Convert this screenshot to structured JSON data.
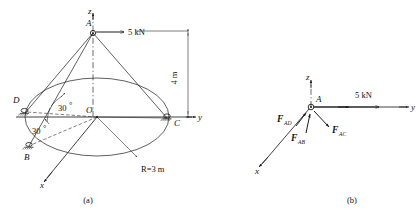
{
  "figure": {
    "panels": [
      {
        "id": "a",
        "caption": "(a)"
      },
      {
        "id": "b",
        "caption": "(b)"
      }
    ]
  },
  "panel_a": {
    "caption": "(a)",
    "axes": {
      "z_label": "z",
      "y_label": "y",
      "x_label": "x",
      "origin_label": "O"
    },
    "points": {
      "apex": "A",
      "support_b": "B",
      "support_c": "C",
      "support_d": "D"
    },
    "loads": {
      "applied_force": "5 kN"
    },
    "dimensions": {
      "height": "4 m",
      "radius": "R=3 m",
      "angle_upper": "30",
      "angle_upper_unit": "°",
      "angle_lower": "30",
      "angle_lower_unit": "°"
    }
  },
  "panel_b": {
    "caption": "(b)",
    "axes": {
      "z_label": "z",
      "y_label": "y",
      "x_label": "x"
    },
    "points": {
      "apex": "A"
    },
    "loads": {
      "applied_force": "5 kN"
    },
    "forces": [
      {
        "symbol": "F",
        "sub": "AD",
        "name": "force-ad"
      },
      {
        "symbol": "F",
        "sub": "AB",
        "name": "force-ab"
      },
      {
        "symbol": "F",
        "sub": "AC",
        "name": "force-ac"
      }
    ]
  },
  "colors": {
    "ink": "#1a1a1a",
    "paper": "#ffffff"
  }
}
